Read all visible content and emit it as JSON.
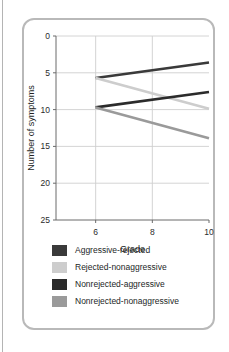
{
  "figure": {
    "axis_label_x": "Grade",
    "axis_label_y": "Number of symptoms"
  },
  "legend": {
    "items": [
      {
        "label": "Aggressive-rejected",
        "color": "#3a3a3a",
        "swatch_name": "legend-swatch-aggressive-rejected"
      },
      {
        "label": "Rejected-nonaggressive",
        "color": "#cdcdcd",
        "swatch_name": "legend-swatch-rejected-nonaggressive"
      },
      {
        "label": "Nonrejected-aggressive",
        "color": "#2b2b2b",
        "swatch_name": "legend-swatch-nonrejected-aggressive"
      },
      {
        "label": "Nonrejected-nonaggressive",
        "color": "#9a9a9a",
        "swatch_name": "legend-swatch-nonrejected-nonaggressive"
      }
    ]
  },
  "ticks": {
    "y": [
      "25",
      "20",
      "15",
      "10",
      "5",
      "0"
    ],
    "x": [
      "6",
      "8",
      "10"
    ]
  },
  "chart_data": {
    "type": "line",
    "title": "",
    "xlabel": "Grade",
    "ylabel": "Number of symptoms",
    "x": [
      6,
      8,
      10
    ],
    "xlim": [
      4.6,
      10
    ],
    "ylim": [
      0,
      25
    ],
    "xticks": [
      6,
      8,
      10
    ],
    "yticks": [
      0,
      5,
      10,
      15,
      20,
      25
    ],
    "grid": "both-light",
    "legend_position": "below-plot",
    "series": [
      {
        "name": "Aggressive-rejected",
        "color": "#3a3a3a",
        "x": [
          6,
          10
        ],
        "values": [
          19.3,
          21.4
        ]
      },
      {
        "name": "Rejected-nonaggressive",
        "color": "#cdcdcd",
        "x": [
          6,
          10
        ],
        "values": [
          19.3,
          15.1
        ]
      },
      {
        "name": "Nonrejected-aggressive",
        "color": "#2b2b2b",
        "x": [
          6,
          10
        ],
        "values": [
          15.3,
          17.4
        ]
      },
      {
        "name": "Nonrejected-nonaggressive",
        "color": "#9a9a9a",
        "x": [
          6,
          10
        ],
        "values": [
          15.3,
          11.1
        ]
      }
    ]
  }
}
